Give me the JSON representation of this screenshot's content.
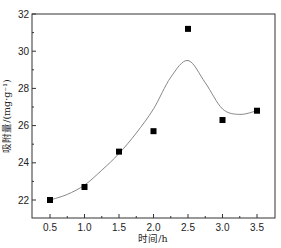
{
  "chart_data": {
    "type": "scatter",
    "title": "",
    "xlabel": "时间/h",
    "ylabel": "吸附量/(mg·g⁻¹)",
    "xlim": [
      0.3,
      3.75
    ],
    "ylim": [
      21,
      32
    ],
    "x_ticks": [
      0.5,
      1.0,
      1.5,
      2.0,
      2.5,
      3.0,
      3.5
    ],
    "x_tick_labels": [
      "0.5",
      "1.0",
      "1.5",
      "2.0",
      "2.5",
      "3.0",
      "3.5"
    ],
    "y_ticks": [
      22,
      24,
      26,
      28,
      30,
      32
    ],
    "y_tick_labels": [
      "22",
      "24",
      "26",
      "28",
      "30",
      "32"
    ],
    "grid": false,
    "legend": null,
    "series": [
      {
        "name": "measured",
        "style": "markers",
        "marker": "square",
        "color": "#000000",
        "x": [
          0.5,
          1.0,
          1.5,
          2.0,
          2.5,
          3.0,
          3.5
        ],
        "values": [
          22.0,
          22.7,
          24.6,
          25.7,
          31.2,
          26.3,
          26.8
        ]
      },
      {
        "name": "fit",
        "style": "line",
        "color": "#888888",
        "x": [
          0.5,
          0.75,
          1.0,
          1.25,
          1.5,
          1.75,
          2.0,
          2.25,
          2.5,
          2.75,
          3.0,
          3.25,
          3.5
        ],
        "values": [
          22.0,
          22.3,
          22.8,
          23.6,
          24.5,
          25.6,
          26.9,
          28.6,
          29.5,
          28.3,
          26.9,
          26.6,
          26.8
        ]
      }
    ]
  }
}
